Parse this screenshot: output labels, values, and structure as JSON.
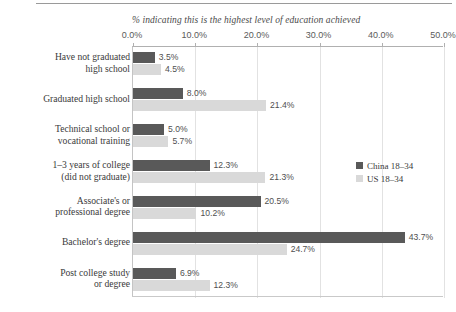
{
  "chart_data": {
    "type": "bar",
    "orientation": "horizontal",
    "title": "",
    "xlabel": "% indicating this is the highest level of education achieved",
    "ylabel": "",
    "xlim": [
      0,
      50
    ],
    "xticks": [
      "0.0%",
      "10.0%",
      "20.0%",
      "30.0%",
      "40.0%",
      "50.0%"
    ],
    "xtick_values": [
      0,
      10,
      20,
      30,
      40,
      50
    ],
    "grid": true,
    "legend_position": "right-middle",
    "categories": [
      "Have not graduated\nhigh school",
      "Graduated high school",
      "Technical school or\nvocational training",
      "1–3 years of college\n(did not graduate)",
      "Associate's or\nprofessional degree",
      "Bachelor's degree",
      "Post college study\nor degree"
    ],
    "series": [
      {
        "name": "China 18–34",
        "color": "#595959",
        "values": [
          3.5,
          8.0,
          5.0,
          12.3,
          20.5,
          43.7,
          6.9
        ],
        "labels": [
          "3.5%",
          "8.0%",
          "5.0%",
          "12.3%",
          "20.5%",
          "43.7%",
          "6.9%"
        ]
      },
      {
        "name": "US 18–34",
        "color": "#d9d9d9",
        "values": [
          4.5,
          21.4,
          5.7,
          21.3,
          10.2,
          24.7,
          12.3
        ],
        "labels": [
          "4.5%",
          "21.4%",
          "5.7%",
          "21.3%",
          "10.2%",
          "24.7%",
          "12.3%"
        ]
      }
    ]
  },
  "legend": {
    "items": [
      {
        "label": "China 18–34",
        "color": "#595959"
      },
      {
        "label": "US 18–34",
        "color": "#d9d9d9"
      }
    ]
  }
}
